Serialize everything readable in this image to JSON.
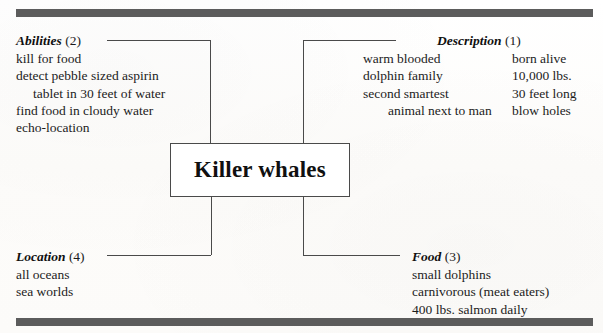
{
  "document": {
    "type": "concept-map",
    "subject": "Killer whales"
  },
  "center": {
    "title": "Killer whales"
  },
  "branches": {
    "abilities": {
      "label": "Abilities",
      "number": "(2)",
      "items": [
        "kill for food",
        "detect pebble sized aspirin",
        "tablet in 30 feet of water",
        "find food in cloudy water",
        "echo-location"
      ],
      "indented_item_indexes": [
        2
      ]
    },
    "description": {
      "label": "Description",
      "number": "(1)",
      "column_left": [
        "warm blooded",
        "dolphin family",
        "second smartest",
        "animal next to man"
      ],
      "column_right": [
        "born alive",
        "10,000 lbs.",
        "30 feet long",
        "blow holes"
      ],
      "indented_left_indexes": [
        3
      ]
    },
    "location": {
      "label": "Location",
      "number": "(4)",
      "items": [
        "all oceans",
        "sea worlds"
      ],
      "indented_item_indexes": []
    },
    "food": {
      "label": "Food",
      "number": "(3)",
      "items": [
        "small dolphins",
        "carnivorous (meat eaters)",
        "400 lbs. salmon daily"
      ],
      "indented_item_indexes": []
    }
  },
  "colors": {
    "rule_bar": "#5c5c5c",
    "line": "#4a4a4a",
    "text": "#1a1a1a",
    "page": "#fdfdfc"
  }
}
